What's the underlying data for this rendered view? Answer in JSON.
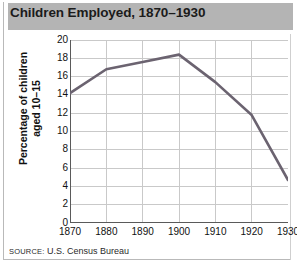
{
  "title": "Children Employed, 1870–1930",
  "source": {
    "prefix": "SOURCE:",
    "text": " U.S. Census Bureau"
  },
  "colors": {
    "title_bar": "#b4b4b4",
    "line": "#6b6370",
    "grid": "#c9c9c9",
    "axis": "#5a5a5a",
    "plot_background": "#ffffff"
  },
  "chart_data": {
    "type": "line",
    "title": "Children Employed, 1870–1930",
    "xlabel": "",
    "ylabel": "Percentage of children aged 10–15",
    "x": [
      1870,
      1880,
      1890,
      1900,
      1910,
      1920,
      1930
    ],
    "values": [
      14.2,
      16.8,
      17.6,
      18.4,
      15.4,
      11.8,
      4.7
    ],
    "categories": [
      "1870",
      "1880",
      "1890",
      "1900",
      "1910",
      "1920",
      "1930"
    ],
    "xlim": [
      1870,
      1930
    ],
    "ylim": [
      0,
      20
    ],
    "ytick_labels": [
      "20",
      "18",
      "16",
      "14",
      "12",
      "10",
      "8",
      "6",
      "4",
      "2",
      "0"
    ],
    "ytick_values": [
      20,
      18,
      16,
      14,
      12,
      10,
      8,
      6,
      4,
      2,
      0
    ],
    "xtick_labels": [
      "1870",
      "1880",
      "1890",
      "1900",
      "1910",
      "1920",
      "1930"
    ],
    "grid": true,
    "legend": false,
    "series": [
      {
        "name": "Percentage of children aged 10–15 employed",
        "values": [
          14.2,
          16.8,
          17.6,
          18.4,
          15.4,
          11.8,
          4.7
        ]
      }
    ]
  }
}
